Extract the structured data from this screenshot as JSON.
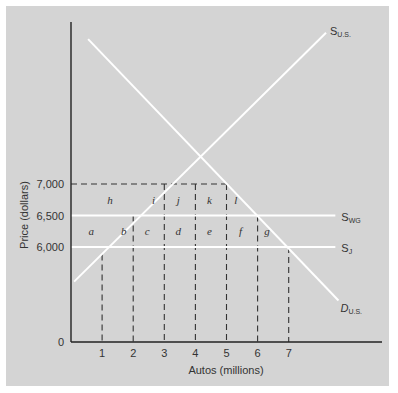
{
  "chart_data": {
    "type": "line",
    "title": "",
    "xlabel": "Autos (millions)",
    "ylabel": "Price (dollars)",
    "x_ticks": [
      "1",
      "2",
      "3",
      "4",
      "5",
      "6",
      "7"
    ],
    "y_ticks": [
      {
        "value": 0,
        "label": "0"
      },
      {
        "value": 6000,
        "label": "6,000"
      },
      {
        "value": 6500,
        "label": "6,500"
      },
      {
        "value": 7000,
        "label": "7,000"
      }
    ],
    "xlim": [
      0,
      10
    ],
    "grid": false,
    "series": [
      {
        "name": "S_U.S.",
        "label_main": "S",
        "label_sub": "U.S.",
        "style": "solid-white",
        "kind": "supply",
        "points": [
          [
            0.1,
            5450
          ],
          [
            8.2,
            9400
          ]
        ]
      },
      {
        "name": "D_U.S.",
        "label_main": "D",
        "label_sub": "U.S.",
        "style": "solid-white",
        "kind": "demand",
        "points": [
          [
            0.55,
            9300
          ],
          [
            8.6,
            5150
          ]
        ]
      },
      {
        "name": "S_WG",
        "label_main": "S",
        "label_sub": "WG",
        "style": "solid-white",
        "kind": "horizontal",
        "points": [
          [
            0,
            6500
          ],
          [
            8.5,
            6500
          ]
        ]
      },
      {
        "name": "S_J",
        "label_main": "S",
        "label_sub": "J",
        "style": "solid-white",
        "kind": "horizontal",
        "points": [
          [
            0,
            6000
          ],
          [
            8.5,
            6000
          ]
        ]
      }
    ],
    "reference_lines": [
      {
        "type": "horizontal-dashed",
        "y": 7000,
        "x_range": [
          0,
          5
        ]
      },
      {
        "type": "vertical-dashed",
        "x": 1,
        "y_range": [
          0,
          5880
        ]
      },
      {
        "type": "vertical-dashed",
        "x": 2,
        "y_range": [
          0,
          6500
        ]
      },
      {
        "type": "vertical-dashed",
        "x": 3,
        "y_range": [
          0,
          7000
        ]
      },
      {
        "type": "vertical-dashed",
        "x": 4,
        "y_range": [
          0,
          7000
        ]
      },
      {
        "type": "vertical-dashed",
        "x": 5,
        "y_range": [
          0,
          7000
        ]
      },
      {
        "type": "vertical-dashed",
        "x": 6,
        "y_range": [
          0,
          6500
        ]
      },
      {
        "type": "vertical-dashed",
        "x": 7,
        "y_range": [
          0,
          6000
        ]
      }
    ],
    "region_labels": [
      {
        "text": "a",
        "x": 0.65,
        "y": 6250
      },
      {
        "text": "b",
        "x": 1.7,
        "y": 6250
      },
      {
        "text": "c",
        "x": 2.45,
        "y": 6250
      },
      {
        "text": "d",
        "x": 3.45,
        "y": 6250
      },
      {
        "text": "e",
        "x": 4.45,
        "y": 6250
      },
      {
        "text": "f",
        "x": 5.45,
        "y": 6250
      },
      {
        "text": "g",
        "x": 6.3,
        "y": 6250
      },
      {
        "text": "h",
        "x": 1.25,
        "y": 6750
      },
      {
        "text": "i",
        "x": 2.65,
        "y": 6750
      },
      {
        "text": "j",
        "x": 3.45,
        "y": 6750
      },
      {
        "text": "k",
        "x": 4.45,
        "y": 6750
      },
      {
        "text": "l",
        "x": 5.3,
        "y": 6750
      }
    ]
  }
}
